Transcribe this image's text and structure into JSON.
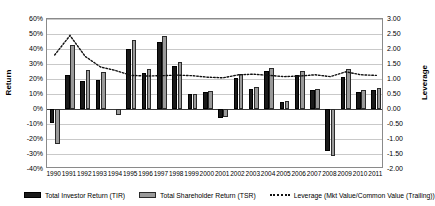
{
  "chart_data": {
    "type": "bar",
    "title": "",
    "xlabel": "",
    "ylabel": "Return",
    "y2label": "Leverage",
    "grid": true,
    "legend_position": "bottom",
    "categories": [
      "1990",
      "1991",
      "1992",
      "1993",
      "1994",
      "1995",
      "1996",
      "1997",
      "1998",
      "1999",
      "2000",
      "2001",
      "2002",
      "2003",
      "2004",
      "2005",
      "2006",
      "2007",
      "2008",
      "2009",
      "2010",
      "2011"
    ],
    "ylim": [
      -0.4,
      0.6
    ],
    "yticks": [
      -0.4,
      -0.3,
      -0.2,
      -0.1,
      0.0,
      0.1,
      0.2,
      0.3,
      0.4,
      0.5,
      0.6
    ],
    "ytick_labels": [
      "-40%",
      "-30%",
      "-20%",
      "-10%",
      "0%",
      "10%",
      "20%",
      "30%",
      "40%",
      "50%",
      "60%"
    ],
    "y2lim": [
      -2.0,
      3.0
    ],
    "y2ticks": [
      -2.0,
      -1.5,
      -1.0,
      -0.5,
      0.0,
      0.5,
      1.0,
      1.5,
      2.0,
      2.5,
      3.0
    ],
    "y2tick_labels": [
      "-2.00",
      "-1.50",
      "-1.00",
      "-0.50",
      "0.00",
      "0.50",
      "1.00",
      "1.50",
      "2.00",
      "2.50",
      "3.00"
    ],
    "series": [
      {
        "name": "Total Investor Return (TIR)",
        "axis": "left",
        "kind": "bar",
        "color": "#1a1a1a",
        "values": [
          -0.09,
          0.23,
          0.185,
          0.195,
          0.0,
          0.4,
          0.24,
          0.45,
          0.29,
          0.1,
          0.115,
          -0.06,
          0.21,
          0.135,
          0.255,
          0.045,
          0.225,
          0.125,
          -0.28,
          0.215,
          0.115,
          0.13
        ]
      },
      {
        "name": "Total Shareholder Return (TSR)",
        "axis": "left",
        "kind": "bar",
        "color": "#9a9a9a",
        "values": [
          -0.23,
          0.43,
          0.26,
          0.245,
          -0.04,
          0.46,
          0.27,
          0.49,
          0.315,
          0.1,
          0.12,
          -0.05,
          0.235,
          0.145,
          0.275,
          0.055,
          0.255,
          0.135,
          -0.31,
          0.265,
          0.125,
          0.14
        ]
      },
      {
        "name": "Leverage (Mkt Value/Common Value (Trailing))",
        "axis": "right",
        "kind": "line",
        "style": "dotted",
        "color": "#111111",
        "values": [
          1.8,
          2.45,
          1.75,
          1.4,
          1.28,
          1.12,
          1.1,
          1.11,
          1.13,
          1.11,
          1.06,
          1.04,
          1.14,
          1.16,
          1.12,
          1.08,
          1.1,
          1.14,
          1.08,
          1.24,
          1.14,
          1.12
        ]
      }
    ],
    "legend": [
      {
        "label": "Total Investor Return (TIR)",
        "marker": "filled-dark-bar"
      },
      {
        "label": "Total Shareholder Return (TSR)",
        "marker": "filled-gray-bar"
      },
      {
        "label": "Leverage (Mkt Value/Common Value (Trailing))",
        "marker": "dotted-line"
      }
    ]
  }
}
